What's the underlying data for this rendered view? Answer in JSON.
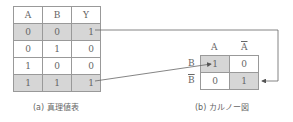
{
  "truth_table": {
    "headers": [
      "A",
      "B",
      "Y"
    ],
    "rows": [
      {
        "a": "0",
        "b": "0",
        "y": "1",
        "highlight": true
      },
      {
        "a": "0",
        "b": "1",
        "y": "0",
        "highlight": false
      },
      {
        "a": "1",
        "b": "0",
        "y": "0",
        "highlight": false
      },
      {
        "a": "1",
        "b": "1",
        "y": "1",
        "highlight": true
      }
    ],
    "caption": "(a) 真理値表"
  },
  "karnaugh_map": {
    "col_headers": [
      "A",
      "A"
    ],
    "col_overline": [
      false,
      true
    ],
    "row_headers": [
      "B",
      "B"
    ],
    "row_overline": [
      false,
      true
    ],
    "cells": [
      [
        "1",
        "0"
      ],
      [
        "0",
        "1"
      ]
    ],
    "highlight": [
      [
        true,
        false
      ],
      [
        false,
        true
      ]
    ],
    "caption": "(b) カルノー図"
  },
  "colors": {
    "highlight": "#d6d6d6",
    "border": "#999999",
    "arrow": "#555555"
  }
}
